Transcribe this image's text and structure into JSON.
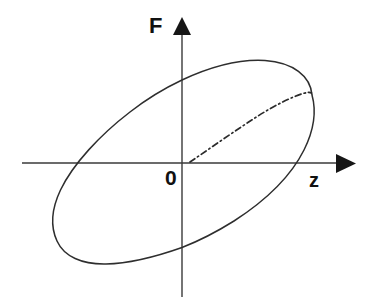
{
  "figure": {
    "kind": "hysteresis-loop-diagram",
    "title": "",
    "background_color": "#ffffff",
    "curve_color": "#2e2e2e",
    "axis_color": "#3a3a3a",
    "label_color": "#111111"
  },
  "labels": {
    "y_axis": "F",
    "x_axis": "z",
    "origin": "0"
  },
  "chart_data": {
    "type": "line",
    "title": "",
    "xlabel": "z",
    "ylabel": "F",
    "grid": false,
    "legend": null,
    "annotations": [
      {
        "text": "F",
        "role": "y-axis-label",
        "x": 152,
        "y": 26
      },
      {
        "text": "z",
        "role": "x-axis-label",
        "x": 315,
        "y": 182
      },
      {
        "text": "0",
        "role": "origin-label",
        "x": 170,
        "y": 179
      }
    ],
    "axes": {
      "origin_px": [
        182,
        163
      ],
      "x_axis_px": {
        "x1": 22,
        "y1": 163,
        "x2": 355,
        "y2": 163,
        "arrow": "right"
      },
      "y_axis_px": {
        "x1": 182,
        "y1": 297,
        "x2": 182,
        "y2": 18,
        "arrow": "up"
      },
      "xlim": null,
      "ylim": null,
      "ticks": []
    },
    "series": [
      {
        "name": "hysteresis-loop",
        "style": "solid",
        "closed": true,
        "shape": "rotated-ellipse",
        "ellipse_px": {
          "cx": 182,
          "cy": 163,
          "rx": 146,
          "ry": 74,
          "rotation_deg": -37
        },
        "path_px": "M 312 95 C 310 75, 292 62, 265 60 C 228 58, 178 72, 135 99 C 82 132, 50 178, 53 216 C 55 243, 76 262, 106 264 C 143 266, 192 251, 234 224 C 286 191, 316 145, 312 95 Z",
        "axis_crossings_px": {
          "x_axis": [
            78,
            288
          ],
          "y_axis": [
            80,
            248
          ]
        }
      },
      {
        "name": "backbone-skeleton-curve",
        "style": "dash-dot",
        "closed": false,
        "path_px": "M 190 162 C 222 140, 255 117, 283 102 C 295 96, 305 93, 311 93",
        "start_px": [
          190,
          162
        ],
        "end_px": [
          311,
          93
        ]
      }
    ]
  }
}
